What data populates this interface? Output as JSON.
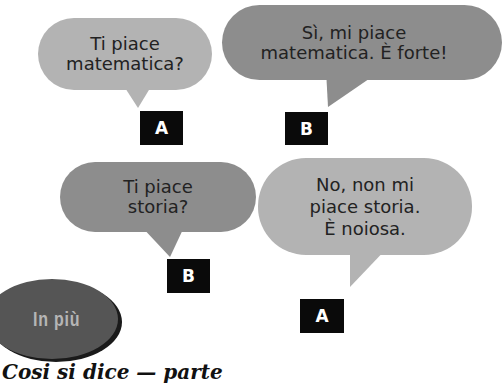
{
  "dialogues": [
    {
      "speaker": "A",
      "text": "Ti piace\nmatematica?",
      "shade": "light"
    },
    {
      "speaker": "B",
      "text": "Sì, mi piace\nmatematica. È forte!",
      "shade": "dark"
    },
    {
      "speaker": "B",
      "text": "Ti piace\nstoria?",
      "shade": "dark"
    },
    {
      "speaker": "A",
      "text": "No, non mi\npiace storia.\nÈ noiosa.",
      "shade": "light"
    }
  ],
  "badge": {
    "label": "In più"
  },
  "bottom_text": "Cosi si dice — parte",
  "colors": {
    "bubble_light": "#b3b3b3",
    "bubble_dark": "#8d8d8d",
    "label_bg": "#0a0a0a",
    "badge_bg": "#555555"
  }
}
